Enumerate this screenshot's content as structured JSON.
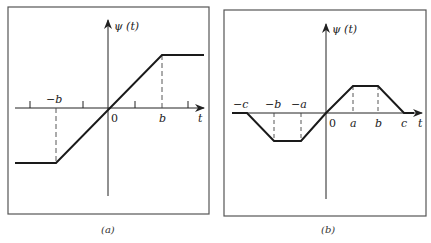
{
  "figure": {
    "panels": [
      {
        "id": "a",
        "caption": "(a)",
        "y_label": "ψ (t)",
        "x_label": "t",
        "origin_label": "0",
        "tick_labels": [
          "−b",
          "b"
        ],
        "description": "Saturating linear function: constant negative for t < −b, linear through origin, constant positive for t > b"
      },
      {
        "id": "b",
        "caption": "(b)",
        "y_label": "ψ (t)",
        "x_label": "t",
        "origin_label": "0",
        "tick_labels": [
          "−c",
          "−b",
          "−a",
          "a",
          "b",
          "c"
        ],
        "description": "Odd trapezoidal (redescending) function: zero for |t| > c, linear rise on (0,a), flat on (a,b), linear descent to zero on (b,c)"
      }
    ]
  },
  "colors": {
    "frame": "#555555",
    "curve": "#1a1a1a",
    "axis": "#222222",
    "dashed": "#444444"
  }
}
